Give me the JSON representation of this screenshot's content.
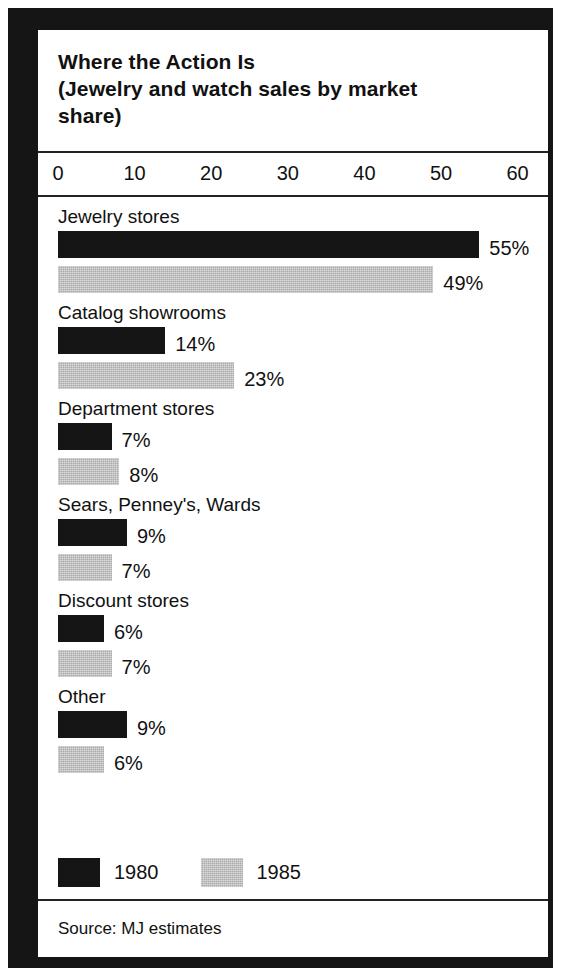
{
  "figure": {
    "title_lines": [
      "Where the Action Is",
      "(Jewelry and watch sales by market",
      "share)"
    ],
    "source": "Source: MJ estimates"
  },
  "legend": {
    "items": [
      {
        "label": "1980",
        "swatch": "dark-solid",
        "color": "#151515"
      },
      {
        "label": "1985",
        "swatch": "gray-halftone",
        "color": "#ababab"
      }
    ]
  },
  "chart_data": {
    "type": "bar",
    "orientation": "horizontal",
    "title": "Where the Action Is (Jewelry and watch sales by market share)",
    "xlabel": "",
    "ylabel": "",
    "xlim": [
      0,
      60
    ],
    "xticks": [
      0,
      10,
      20,
      30,
      40,
      50,
      60
    ],
    "xtick_labels": [
      "0",
      "10",
      "20",
      "30",
      "40",
      "50",
      "60"
    ],
    "grid": false,
    "legend_position": "bottom-left",
    "value_suffix": "%",
    "categories": [
      "Jewelry stores",
      "Catalog showrooms",
      "Department stores",
      "Sears, Penney's, Wards",
      "Discount stores",
      "Other"
    ],
    "series": [
      {
        "name": "1980",
        "color": "#151515",
        "values": [
          55,
          14,
          7,
          9,
          6,
          9
        ]
      },
      {
        "name": "1985",
        "color": "#ababab",
        "values": [
          49,
          23,
          8,
          7,
          7,
          6
        ]
      }
    ],
    "value_labels": {
      "1980": [
        "55%",
        "14%",
        "7%",
        "9%",
        "6%",
        "9%"
      ],
      "1985": [
        "49%",
        "23%",
        "8%",
        "7%",
        "7%",
        "6%"
      ]
    },
    "source": "Source: MJ estimates"
  }
}
